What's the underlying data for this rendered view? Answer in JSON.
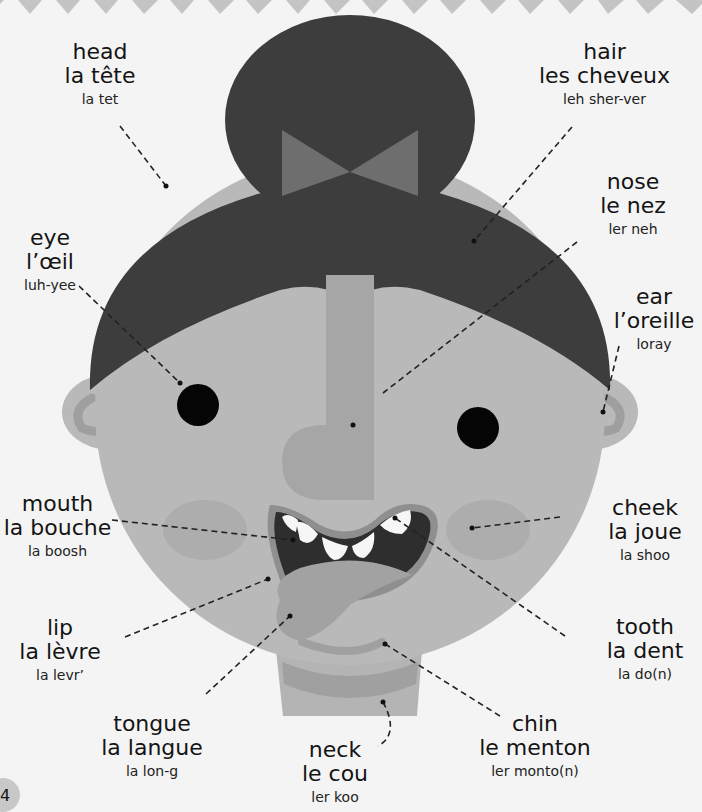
{
  "page_number": "4",
  "colors": {
    "background": "#f4f4f4",
    "zigzag": "#c4c4c4",
    "hair": "#3d3d3d",
    "bow": "#6e6e6e",
    "skin": "#b9b9b9",
    "nose": "#a6a6a6",
    "cheek": "#adadad",
    "ear_inner": "#9f9f9f",
    "eye": "#050505",
    "mouth": "#2e2e2e",
    "lip": "#8f8f8f",
    "teeth": "#f6f6f6",
    "tongue": "#a2a2a2",
    "chin_line": "#a0a0a0",
    "neck": "#b4b4b4",
    "neck_shadow": "#a0a0a0",
    "leader": "#222222"
  },
  "labels": [
    {
      "id": "head",
      "english": "head",
      "french": "la tête",
      "pronunciation": "la tet"
    },
    {
      "id": "hair",
      "english": "hair",
      "french": "les cheveux",
      "pronunciation": "leh sher-ver"
    },
    {
      "id": "nose",
      "english": "nose",
      "french": "le nez",
      "pronunciation": "ler neh"
    },
    {
      "id": "eye",
      "english": "eye",
      "french": "l’œil",
      "pronunciation": "luh-yee"
    },
    {
      "id": "ear",
      "english": "ear",
      "french": "l’oreille",
      "pronunciation": "loray"
    },
    {
      "id": "mouth",
      "english": "mouth",
      "french": "la bouche",
      "pronunciation": "la boosh"
    },
    {
      "id": "cheek",
      "english": "cheek",
      "french": "la joue",
      "pronunciation": "la shoo"
    },
    {
      "id": "lip",
      "english": "lip",
      "french": "la lèvre",
      "pronunciation": "la levr’"
    },
    {
      "id": "tooth",
      "english": "tooth",
      "french": "la dent",
      "pronunciation": "la do(n)"
    },
    {
      "id": "tongue",
      "english": "tongue",
      "french": "la langue",
      "pronunciation": "la lon-g"
    },
    {
      "id": "neck",
      "english": "neck",
      "french": "le cou",
      "pronunciation": "ler koo"
    },
    {
      "id": "chin",
      "english": "chin",
      "french": "le menton",
      "pronunciation": "ler monto(n)"
    }
  ]
}
